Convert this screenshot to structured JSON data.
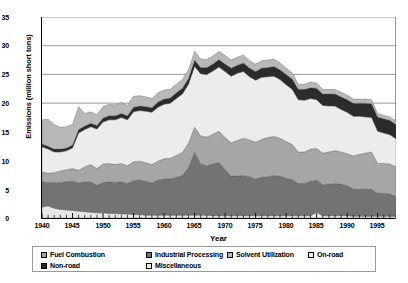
{
  "chart_data": {
    "type": "area",
    "stacked": true,
    "title": "",
    "xlabel": "Year",
    "ylabel": "Emissions (million short tons)",
    "xlim": [
      1940,
      1998
    ],
    "ylim": [
      0,
      35
    ],
    "ytick_values": [
      0,
      5,
      10,
      15,
      20,
      25,
      30,
      35
    ],
    "xtick_values": [
      1940,
      1945,
      1950,
      1955,
      1960,
      1965,
      1970,
      1975,
      1980,
      1985,
      1990,
      1995
    ],
    "grid": "horizontal",
    "legend_position": "below",
    "x": [
      1940,
      1941,
      1942,
      1943,
      1944,
      1945,
      1946,
      1947,
      1948,
      1949,
      1950,
      1951,
      1952,
      1953,
      1954,
      1955,
      1956,
      1957,
      1958,
      1959,
      1960,
      1961,
      1962,
      1963,
      1964,
      1965,
      1966,
      1967,
      1968,
      1969,
      1970,
      1971,
      1972,
      1973,
      1974,
      1975,
      1976,
      1977,
      1978,
      1979,
      1980,
      1981,
      1982,
      1983,
      1984,
      1985,
      1986,
      1987,
      1988,
      1989,
      1990,
      1991,
      1992,
      1993,
      1994,
      1995,
      1996,
      1997,
      1998
    ],
    "series": [
      {
        "name": "Miscellaneous",
        "color": "#e8e8e8",
        "stack_order": 1,
        "values": [
          1.9,
          2.1,
          1.7,
          1.5,
          1.4,
          1.3,
          1.2,
          1.1,
          1.0,
          0.9,
          0.9,
          0.8,
          0.8,
          0.7,
          0.7,
          0.6,
          0.6,
          0.5,
          0.5,
          0.5,
          0.5,
          0.5,
          0.5,
          0.5,
          0.5,
          0.5,
          0.5,
          0.5,
          0.4,
          0.4,
          0.4,
          0.4,
          0.4,
          0.4,
          0.4,
          0.4,
          0.4,
          0.4,
          0.4,
          0.4,
          0.4,
          0.4,
          0.4,
          0.4,
          0.4,
          1.0,
          0.4,
          0.4,
          0.4,
          0.4,
          0.4,
          0.3,
          0.3,
          0.3,
          0.3,
          0.3,
          0.3,
          0.3,
          0.3
        ]
      },
      {
        "name": "Industrial Processing",
        "color": "#737373",
        "stack_order": 2,
        "values": [
          4.4,
          4.1,
          4.5,
          4.7,
          4.9,
          5.1,
          4.9,
          5.2,
          5.3,
          4.8,
          5.3,
          5.5,
          5.4,
          5.6,
          5.3,
          5.9,
          6.0,
          5.9,
          5.6,
          6.1,
          6.3,
          6.3,
          6.6,
          6.9,
          8.3,
          10.9,
          8.9,
          8.6,
          9.0,
          9.3,
          8.0,
          6.9,
          6.9,
          7.0,
          6.8,
          6.4,
          6.7,
          6.8,
          7.0,
          6.9,
          6.5,
          6.3,
          5.6,
          5.6,
          6.0,
          5.6,
          5.4,
          5.5,
          5.6,
          5.5,
          5.2,
          4.7,
          4.7,
          4.7,
          4.7,
          4.0,
          4.0,
          3.9,
          3.4
        ]
      },
      {
        "name": "Fuel Combustion",
        "color": "#a6a6a6",
        "stack_order": 3,
        "values": [
          1.7,
          1.6,
          1.7,
          2.0,
          2.1,
          2.2,
          2.2,
          2.6,
          3.0,
          2.9,
          3.2,
          3.2,
          3.1,
          3.2,
          3.1,
          3.3,
          3.3,
          3.2,
          3.2,
          3.3,
          3.5,
          3.6,
          3.8,
          4.0,
          4.2,
          4.4,
          4.9,
          5.0,
          5.2,
          5.4,
          5.6,
          5.8,
          6.2,
          6.5,
          6.4,
          6.4,
          6.6,
          6.8,
          6.8,
          6.6,
          6.4,
          6.1,
          5.5,
          5.5,
          5.6,
          5.5,
          5.5,
          5.6,
          5.7,
          5.6,
          5.6,
          5.8,
          6.1,
          6.3,
          6.5,
          5.2,
          5.2,
          5.2,
          5.2
        ]
      },
      {
        "name": "On-road",
        "color": "#ececec",
        "stack_order": 4,
        "values": [
          4.4,
          4.2,
          3.6,
          3.3,
          3.3,
          3.6,
          6.5,
          6.5,
          6.6,
          6.9,
          7.3,
          7.6,
          7.8,
          8.0,
          8.0,
          8.7,
          8.8,
          9.0,
          9.1,
          9.4,
          9.5,
          9.6,
          9.9,
          10.2,
          10.3,
          10.6,
          10.8,
          10.9,
          11.0,
          11.2,
          11.5,
          11.6,
          11.7,
          11.6,
          11.0,
          10.8,
          10.8,
          10.6,
          10.5,
          10.2,
          9.9,
          9.6,
          9.1,
          9.0,
          8.8,
          8.5,
          8.3,
          8.0,
          7.8,
          7.4,
          7.2,
          6.9,
          6.6,
          6.3,
          6.0,
          5.6,
          5.3,
          5.1,
          4.9
        ]
      },
      {
        "name": "Non-road",
        "color": "#2b2b2b",
        "stack_order": 5,
        "values": [
          0.5,
          0.5,
          0.5,
          0.5,
          0.5,
          0.5,
          0.6,
          0.6,
          0.6,
          0.6,
          0.7,
          0.7,
          0.7,
          0.7,
          0.7,
          0.8,
          0.8,
          0.8,
          0.8,
          0.9,
          0.9,
          0.9,
          1.0,
          1.0,
          1.0,
          1.1,
          1.1,
          1.2,
          1.2,
          1.3,
          1.3,
          1.4,
          1.4,
          1.5,
          1.5,
          1.5,
          1.6,
          1.6,
          1.7,
          1.7,
          1.8,
          1.8,
          1.8,
          1.9,
          1.9,
          2.0,
          2.0,
          2.1,
          2.1,
          2.2,
          2.2,
          2.3,
          2.3,
          2.4,
          2.4,
          2.5,
          2.5,
          2.5,
          2.5
        ]
      },
      {
        "name": "Solvent Utilization",
        "color": "#b8b8b8",
        "stack_order": 6,
        "values": [
          4.2,
          4.7,
          4.3,
          3.8,
          3.7,
          3.6,
          4.0,
          2.2,
          2.0,
          1.9,
          2.0,
          2.0,
          1.9,
          1.9,
          1.8,
          1.9,
          1.8,
          1.7,
          1.6,
          1.6,
          1.6,
          1.5,
          1.5,
          1.5,
          1.5,
          1.5,
          1.5,
          1.4,
          1.4,
          1.4,
          1.5,
          1.4,
          1.4,
          1.4,
          1.3,
          1.3,
          1.3,
          1.3,
          1.3,
          1.2,
          1.1,
          1.0,
          0.9,
          0.9,
          1.0,
          0.9,
          0.8,
          0.8,
          0.8,
          0.8,
          0.8,
          0.7,
          0.7,
          0.7,
          0.7,
          0.6,
          0.6,
          0.6,
          0.6
        ]
      }
    ]
  },
  "axes": {
    "y_ticks": [
      "35",
      "30",
      "25",
      "20",
      "15",
      "10",
      "5",
      "0"
    ],
    "x_ticks": [
      "1940",
      "1945",
      "1950",
      "1955",
      "1960",
      "1965",
      "1970",
      "1975",
      "1980",
      "1985",
      "1990",
      "1995"
    ],
    "y_title": "Emissions (million short tons)",
    "x_title": "Year"
  },
  "legend": {
    "row1": [
      {
        "label": "Fuel Combustion",
        "color": "#a6a6a6"
      },
      {
        "label": "Industrial Processing",
        "color": "#737373"
      },
      {
        "label": "Solvent Utilization",
        "color": "#b8b8b8"
      },
      {
        "label": "On-road",
        "color": "#ececec"
      }
    ],
    "row2": [
      {
        "label": "Non-road",
        "color": "#2b2b2b"
      },
      {
        "label": "Miscellaneous",
        "color": "#e8e8e8"
      }
    ]
  }
}
